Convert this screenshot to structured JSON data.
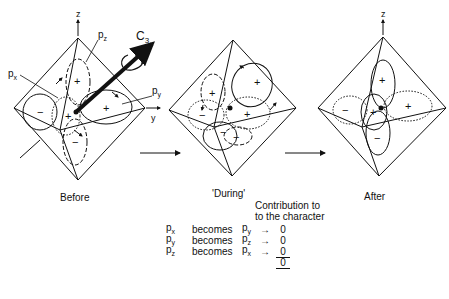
{
  "figure": {
    "panels": [
      {
        "caption": "Before"
      },
      {
        "caption": "'During'"
      },
      {
        "caption": "After"
      }
    ],
    "axis_labels": {
      "z": "z",
      "y": "y"
    },
    "orbital_labels": {
      "px": "p",
      "px_sub": "x",
      "py": "p",
      "py_sub": "y",
      "pz": "p",
      "pz_sub": "z"
    },
    "axis_symbol": "C",
    "axis_symbol_sub": "3",
    "signs": {
      "plus": "+",
      "minus": "−"
    }
  },
  "table": {
    "header_line1": "Contribution to",
    "header_line2": "to the character",
    "rows": [
      {
        "from": "p",
        "from_sub": "x",
        "verb": "becomes",
        "to": "p",
        "to_sub": "y",
        "value": "0"
      },
      {
        "from": "p",
        "from_sub": "y",
        "verb": "becomes",
        "to": "p",
        "to_sub": "z",
        "value": "0"
      },
      {
        "from": "p",
        "from_sub": "z",
        "verb": "becomes",
        "to": "p",
        "to_sub": "x",
        "value": "0"
      }
    ],
    "total": "0"
  }
}
